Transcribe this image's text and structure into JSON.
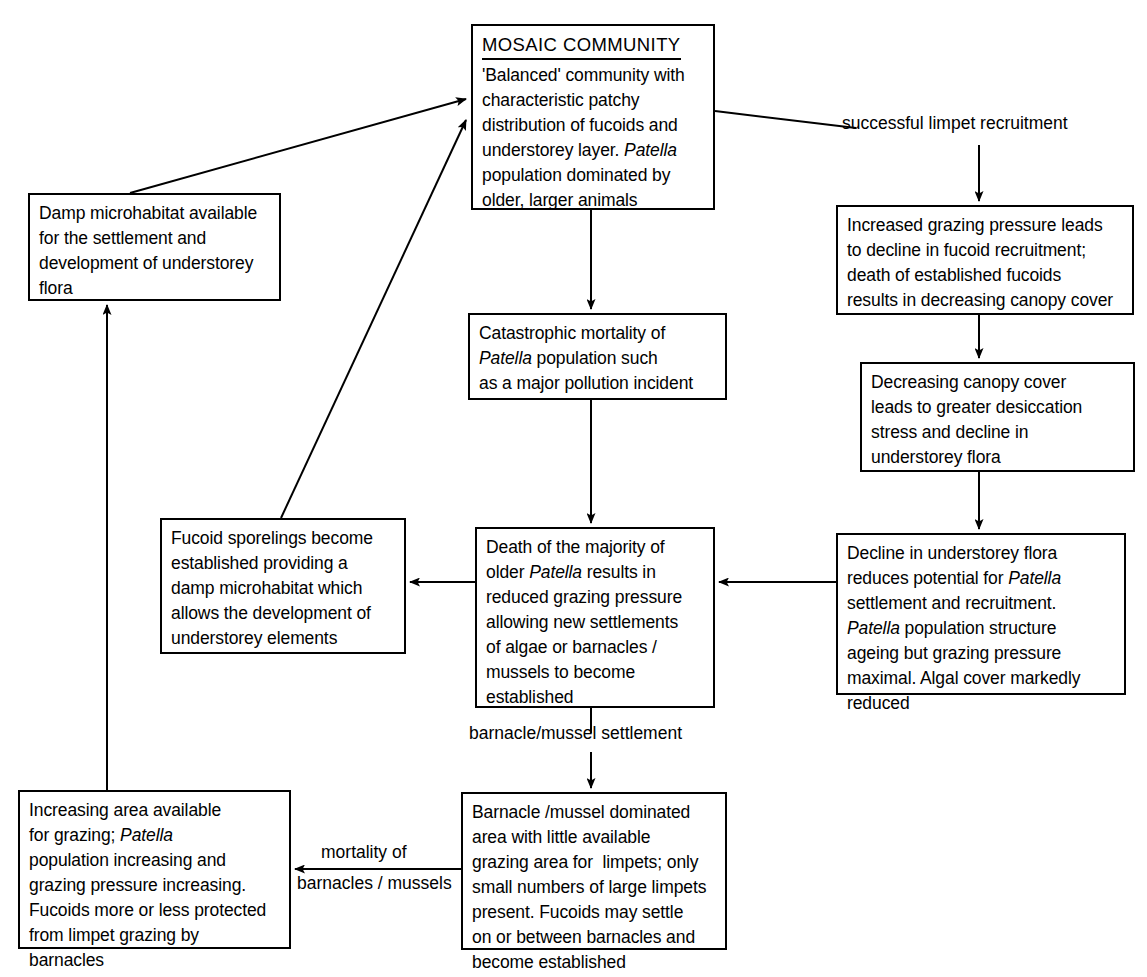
{
  "diagram": {
    "stroke_color": "#000000",
    "background_color": "#ffffff"
  },
  "nodes": {
    "mosaic": {
      "header": "MOSAIC COMMUNITY",
      "lines": [
        "'Balanced' community with",
        "characteristic patchy",
        "distribution of fucoids and",
        "understorey layer. |Patella|",
        "population dominated by",
        "older, larger animals"
      ]
    },
    "damp": {
      "lines": [
        "Damp microhabitat available",
        "for the settlement and",
        "development of understorey",
        "flora"
      ]
    },
    "increased": {
      "lines": [
        "Increased grazing pressure leads",
        "to decline in fucoid recruitment;",
        "death of established fucoids",
        "results in decreasing canopy cover"
      ]
    },
    "catastrophic": {
      "lines": [
        "Catastrophic mortality of",
        "|Patella| population such",
        "as a major pollution incident"
      ]
    },
    "decreasing": {
      "lines": [
        "Decreasing canopy cover",
        "leads to greater desiccation",
        "stress and decline in",
        "understorey flora"
      ]
    },
    "fucoid": {
      "lines": [
        "Fucoid sporelings become",
        "established providing a",
        "damp microhabitat which",
        "allows the development of",
        "understorey elements"
      ]
    },
    "death": {
      "lines": [
        "Death of the majority of",
        "older |Patella| results in",
        "reduced grazing pressure",
        "allowing new settlements",
        "of algae or barnacles /",
        "mussels to become",
        "established"
      ]
    },
    "decline": {
      "lines": [
        "Decline in understorey flora",
        "reduces potential for |Patella|",
        "settlement and recruitment.",
        "|Patella| population structure",
        "ageing but grazing pressure",
        "maximal. Algal cover markedly",
        "reduced"
      ]
    },
    "increasing": {
      "lines": [
        "Increasing area available",
        "for grazing; |Patella|",
        "population increasing and",
        "grazing pressure increasing.",
        "Fucoids more or less protected",
        "from limpet grazing by",
        "barnacles"
      ]
    },
    "barnacle": {
      "lines": [
        "Barnacle /mussel dominated",
        "area with little available",
        "grazing area for  limpets; only",
        "small numbers of large limpets",
        "present. Fucoids may settle",
        "on or between barnacles and",
        "become established"
      ]
    }
  },
  "edge_labels": {
    "successful_recruitment": "successful limpet recruitment",
    "barnacle_mussel_settlement": "barnacle/mussel settlement",
    "mortality_of": "mortality of",
    "barnacles_mussels": "barnacles / mussels"
  }
}
